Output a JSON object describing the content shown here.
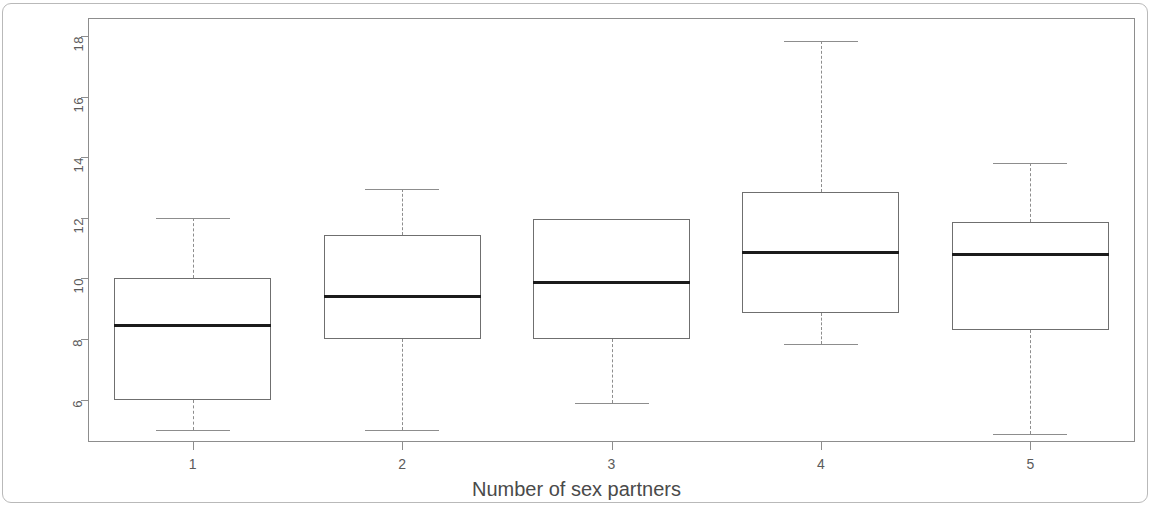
{
  "chart": {
    "type": "boxplot",
    "xlabel": "Number of sex partners",
    "ylabel": "Total risk perception score",
    "y_tick_labels": [
      "6",
      "8",
      "10",
      "12",
      "14",
      "16",
      "18"
    ],
    "x_tick_labels": [
      "1",
      "2",
      "3",
      "4",
      "5"
    ],
    "axis_color": "#8d8d8d",
    "median_color": "#1b1b1b",
    "frame_color": "#b9b9b9"
  },
  "chart_data": {
    "type": "box",
    "title": "",
    "xlabel": "Number of sex partners",
    "ylabel": "Total risk perception score",
    "categories": [
      "1",
      "2",
      "3",
      "4",
      "5"
    ],
    "ylim": [
      4.6,
      18.6
    ],
    "yticks": [
      6,
      8,
      10,
      12,
      14,
      16,
      18
    ],
    "grid": false,
    "legend": null,
    "boxes": [
      {
        "category": "1",
        "whisker_low": 5.0,
        "q1": 6.0,
        "median": 8.5,
        "q3": 10.0,
        "whisker_high": 12.0
      },
      {
        "category": "2",
        "whisker_low": 5.0,
        "q1": 8.0,
        "median": 9.45,
        "q3": 11.45,
        "whisker_high": 12.95
      },
      {
        "category": "3",
        "whisker_low": 5.9,
        "q1": 8.0,
        "median": 9.9,
        "q3": 11.95,
        "whisker_high": 11.95
      },
      {
        "category": "4",
        "whisker_low": 7.85,
        "q1": 8.85,
        "median": 10.9,
        "q3": 12.85,
        "whisker_high": 17.85
      },
      {
        "category": "5",
        "whisker_low": 4.85,
        "q1": 8.3,
        "median": 10.85,
        "q3": 11.85,
        "whisker_high": 13.8
      }
    ]
  }
}
